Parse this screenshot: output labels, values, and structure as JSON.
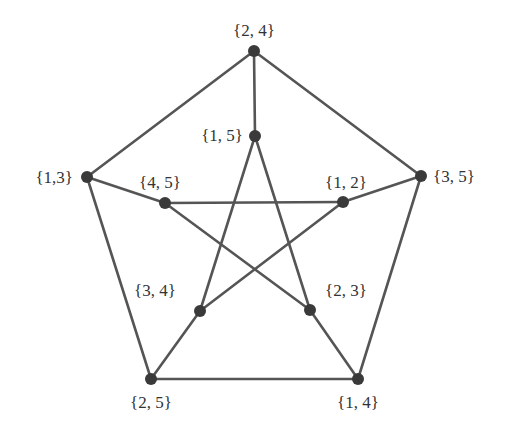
{
  "colors": {
    "edge": "#555555",
    "node": "#3a3a3a",
    "label": "#333333",
    "background": "#ffffff"
  },
  "nodes": [
    {
      "id": "24",
      "label": "{2, 4}",
      "x": 254,
      "y": 51,
      "lx": 254,
      "ly": 36,
      "anchor": "middle"
    },
    {
      "id": "13",
      "label": "{1,3}",
      "x": 87,
      "y": 177,
      "lx": 73,
      "ly": 183,
      "anchor": "end"
    },
    {
      "id": "35",
      "label": "{3, 5}",
      "x": 421,
      "y": 176,
      "lx": 433,
      "ly": 182,
      "anchor": "start"
    },
    {
      "id": "25",
      "label": "{2, 5}",
      "x": 151,
      "y": 379,
      "lx": 151,
      "ly": 408,
      "anchor": "middle"
    },
    {
      "id": "14",
      "label": "{1, 4}",
      "x": 358,
      "y": 379,
      "lx": 358,
      "ly": 408,
      "anchor": "middle"
    },
    {
      "id": "15",
      "label": "{1, 5}",
      "x": 255,
      "y": 136,
      "lx": 243,
      "ly": 141,
      "anchor": "end"
    },
    {
      "id": "45",
      "label": "{4, 5}",
      "x": 165,
      "y": 203,
      "lx": 160,
      "ly": 188,
      "anchor": "middle"
    },
    {
      "id": "12",
      "label": "{1, 2}",
      "x": 343,
      "y": 202,
      "lx": 346,
      "ly": 188,
      "anchor": "middle"
    },
    {
      "id": "34",
      "label": "{3, 4}",
      "x": 200,
      "y": 311,
      "lx": 155,
      "ly": 296,
      "anchor": "middle"
    },
    {
      "id": "23",
      "label": "{2, 3}",
      "x": 310,
      "y": 310,
      "lx": 346,
      "ly": 296,
      "anchor": "middle"
    }
  ],
  "edges": [
    [
      "24",
      "13"
    ],
    [
      "24",
      "35"
    ],
    [
      "13",
      "25"
    ],
    [
      "35",
      "14"
    ],
    [
      "25",
      "14"
    ],
    [
      "24",
      "15"
    ],
    [
      "13",
      "45"
    ],
    [
      "35",
      "12"
    ],
    [
      "25",
      "34"
    ],
    [
      "14",
      "23"
    ],
    [
      "15",
      "34"
    ],
    [
      "15",
      "23"
    ],
    [
      "45",
      "12"
    ],
    [
      "45",
      "23"
    ],
    [
      "12",
      "34"
    ]
  ]
}
